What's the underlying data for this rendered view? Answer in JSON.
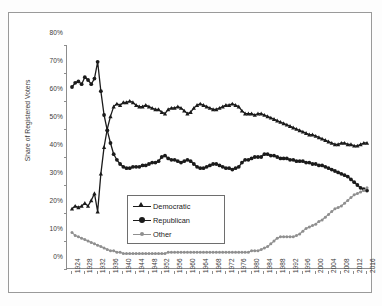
{
  "chart_data": {
    "type": "line",
    "title": "",
    "xlabel": "",
    "ylabel": "Share of Registered Voters",
    "ylim": [
      0,
      80
    ],
    "yticks": [
      0,
      10,
      20,
      30,
      40,
      50,
      60,
      70,
      80
    ],
    "ytick_labels": [
      "0%",
      "10%",
      "20%",
      "30%",
      "40%",
      "50%",
      "60%",
      "70%",
      "80%"
    ],
    "grid": false,
    "legend_position": "inside-center-lower",
    "x": [
      1924,
      1925,
      1926,
      1927,
      1928,
      1929,
      1930,
      1931,
      1932,
      1933,
      1934,
      1935,
      1936,
      1937,
      1938,
      1939,
      1940,
      1941,
      1942,
      1943,
      1944,
      1945,
      1946,
      1947,
      1948,
      1949,
      1950,
      1951,
      1952,
      1953,
      1954,
      1955,
      1956,
      1957,
      1958,
      1959,
      1960,
      1961,
      1962,
      1963,
      1964,
      1965,
      1966,
      1967,
      1968,
      1969,
      1970,
      1971,
      1972,
      1973,
      1974,
      1975,
      1976,
      1977,
      1978,
      1979,
      1980,
      1981,
      1982,
      1983,
      1984,
      1985,
      1986,
      1987,
      1988,
      1989,
      1990,
      1991,
      1992,
      1993,
      1994,
      1995,
      1996,
      1997,
      1998,
      1999,
      2000,
      2001,
      2002,
      2003,
      2004,
      2005,
      2006,
      2007,
      2008,
      2009,
      2010,
      2011,
      2012,
      2013,
      2014,
      2015,
      2016
    ],
    "xtick_labels": [
      "1924",
      "1928",
      "1932",
      "1936",
      "1940",
      "1944",
      "1948",
      "1952",
      "1956",
      "1960",
      "1964",
      "1968",
      "1972",
      "1976",
      "1980",
      "1984",
      "1988",
      "1992",
      "1996",
      "2000",
      "2004",
      "2008",
      "2012",
      "2016"
    ],
    "series": [
      {
        "name": "Democratic",
        "color": "#1b1b1b",
        "marker": "triangle",
        "values": [
          21.5,
          22.5,
          22.0,
          22.5,
          23.5,
          22.5,
          24.5,
          27.0,
          20.5,
          34.0,
          43.5,
          50.0,
          54.5,
          58.0,
          59.0,
          58.5,
          59.5,
          59.5,
          60.0,
          59.5,
          58.5,
          58.0,
          58.0,
          58.5,
          58.0,
          57.5,
          57.0,
          57.0,
          56.0,
          55.5,
          57.0,
          57.5,
          57.5,
          58.0,
          57.5,
          56.5,
          55.5,
          56.0,
          57.5,
          58.5,
          59.0,
          58.5,
          58.0,
          57.5,
          57.0,
          57.0,
          57.5,
          58.0,
          58.5,
          58.5,
          59.0,
          58.5,
          58.0,
          56.5,
          55.5,
          55.5,
          55.5,
          55.0,
          55.5,
          55.5,
          55.0,
          54.5,
          54.0,
          53.5,
          53.0,
          52.5,
          52.0,
          51.5,
          51.0,
          50.5,
          50.0,
          49.5,
          49.0,
          48.5,
          48.0,
          48.0,
          47.5,
          47.0,
          46.5,
          46.0,
          45.5,
          45.0,
          44.5,
          44.5,
          45.0,
          45.0,
          44.5,
          44.5,
          44.0,
          44.0,
          44.5,
          45.0,
          45.0
        ]
      },
      {
        "name": "Republican",
        "color": "#1b1b1b",
        "marker": "circle",
        "values": [
          65.0,
          66.5,
          67.0,
          66.0,
          68.5,
          67.5,
          66.0,
          68.0,
          74.0,
          63.5,
          55.0,
          49.5,
          45.0,
          41.0,
          39.0,
          37.5,
          36.5,
          36.0,
          36.0,
          36.5,
          36.5,
          36.5,
          37.0,
          37.0,
          37.5,
          38.0,
          38.0,
          38.5,
          40.0,
          40.5,
          39.5,
          39.0,
          39.0,
          38.5,
          38.0,
          38.5,
          39.0,
          38.5,
          37.5,
          36.5,
          36.0,
          36.0,
          36.5,
          37.0,
          37.5,
          37.5,
          37.0,
          36.5,
          36.0,
          36.0,
          35.5,
          36.0,
          36.5,
          38.0,
          39.0,
          39.0,
          39.5,
          40.0,
          40.0,
          40.0,
          41.0,
          41.0,
          40.5,
          40.5,
          40.0,
          39.5,
          39.5,
          39.5,
          39.0,
          39.0,
          38.5,
          38.5,
          38.5,
          38.0,
          38.0,
          37.5,
          37.5,
          37.0,
          37.0,
          36.5,
          36.0,
          35.5,
          35.0,
          34.5,
          34.0,
          33.5,
          33.0,
          32.0,
          31.0,
          30.0,
          29.0,
          28.5,
          28.0
        ]
      },
      {
        "name": "Other",
        "color": "#8f8f8f",
        "marker": "circle",
        "values": [
          13.0,
          12.0,
          11.5,
          11.0,
          10.5,
          10.0,
          9.5,
          9.0,
          8.5,
          8.0,
          7.5,
          7.0,
          6.5,
          6.5,
          6.0,
          6.0,
          5.5,
          5.5,
          5.5,
          5.5,
          5.5,
          5.5,
          5.5,
          5.5,
          5.5,
          5.5,
          5.5,
          5.5,
          5.5,
          5.5,
          6.0,
          6.0,
          6.0,
          6.0,
          6.0,
          6.0,
          6.0,
          6.0,
          6.0,
          6.0,
          6.0,
          6.0,
          6.0,
          6.0,
          6.0,
          6.0,
          6.0,
          6.0,
          6.0,
          6.0,
          6.0,
          6.0,
          6.0,
          6.0,
          6.0,
          6.0,
          6.5,
          6.5,
          6.5,
          7.0,
          7.5,
          8.0,
          9.0,
          10.0,
          11.0,
          11.5,
          11.5,
          11.5,
          11.5,
          11.5,
          12.0,
          12.5,
          13.5,
          14.5,
          15.0,
          15.5,
          16.0,
          17.0,
          17.5,
          18.5,
          19.5,
          20.5,
          21.5,
          22.0,
          22.5,
          23.5,
          24.5,
          25.5,
          26.5,
          27.0,
          27.5,
          28.0,
          29.0
        ]
      }
    ],
    "legend": [
      {
        "label": "Democratic",
        "marker": "triangle",
        "color": "#1b1b1b"
      },
      {
        "label": "Republican",
        "marker": "circle",
        "color": "#1b1b1b"
      },
      {
        "label": "Other",
        "marker": "circle",
        "color": "#8f8f8f"
      }
    ]
  }
}
